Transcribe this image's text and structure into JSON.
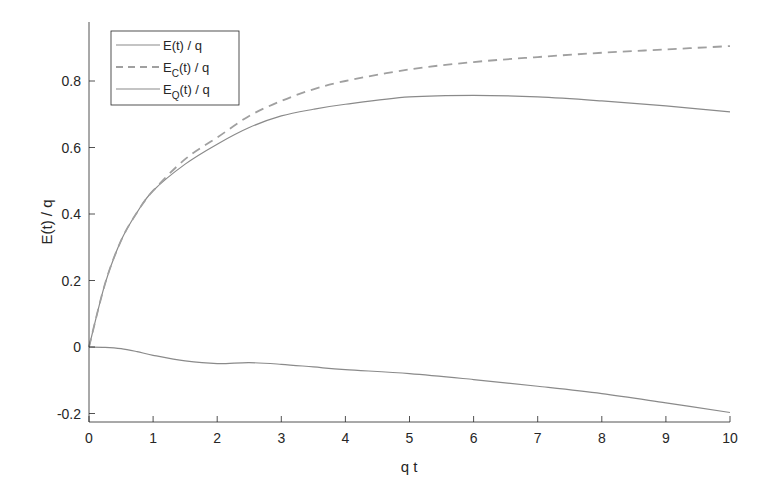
{
  "chart_data": {
    "type": "line",
    "title": "",
    "xlabel": "q t",
    "ylabel": "E(t) / q",
    "xlim": [
      0,
      10
    ],
    "ylim": [
      -0.225,
      0.965
    ],
    "xticks": [
      0,
      1,
      2,
      3,
      4,
      5,
      6,
      7,
      8,
      9,
      10
    ],
    "yticks": [
      -0.2,
      0,
      0.2,
      0.4,
      0.6,
      0.8
    ],
    "xtick_labels": [
      "0",
      "1",
      "2",
      "3",
      "4",
      "5",
      "6",
      "7",
      "8",
      "9",
      "10"
    ],
    "ytick_labels": [
      "-0.2",
      "0",
      "0.2",
      "0.4",
      "0.6",
      "0.8"
    ],
    "grid": false,
    "legend_position": "upper left",
    "x": [
      0,
      0.25,
      0.5,
      0.75,
      1,
      1.5,
      2,
      2.5,
      3,
      3.5,
      4,
      5,
      6,
      7,
      8,
      9,
      10
    ],
    "series": [
      {
        "name": "E(t) / q",
        "legend_main": "E",
        "legend_sub": "",
        "legend_rest": "(t) / q",
        "style": "solid",
        "color": "#8a8a8a",
        "values": [
          0,
          0.19,
          0.32,
          0.405,
          0.47,
          0.55,
          0.61,
          0.66,
          0.695,
          0.715,
          0.73,
          0.752,
          0.757,
          0.752,
          0.74,
          0.725,
          0.707
        ]
      },
      {
        "name": "E_C(t) / q",
        "legend_main": "E",
        "legend_sub": "C",
        "legend_rest": "(t) / q",
        "style": "dashed",
        "color": "#a0a0a0",
        "values": [
          0,
          0.19,
          0.32,
          0.405,
          0.47,
          0.565,
          0.63,
          0.695,
          0.74,
          0.775,
          0.8,
          0.835,
          0.857,
          0.872,
          0.885,
          0.895,
          0.905
        ]
      },
      {
        "name": "E_Q(t) / q",
        "legend_main": "E",
        "legend_sub": "Q",
        "legend_rest": "(t) / q",
        "style": "solid",
        "color": "#8a8a8a",
        "values": [
          0,
          -0.001,
          -0.005,
          -0.014,
          -0.025,
          -0.042,
          -0.05,
          -0.047,
          -0.052,
          -0.06,
          -0.068,
          -0.08,
          -0.098,
          -0.118,
          -0.14,
          -0.168,
          -0.197
        ]
      }
    ]
  }
}
